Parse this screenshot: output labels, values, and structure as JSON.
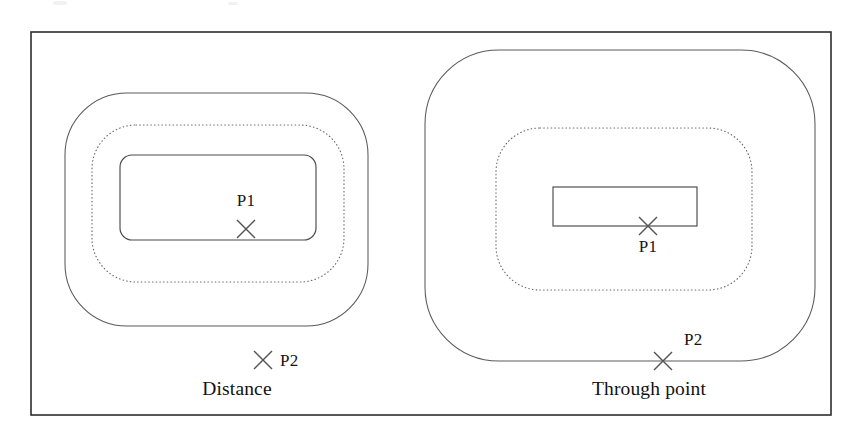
{
  "figure": {
    "kind": "offset-contour-comparison-diagram",
    "frame": {
      "x": 31,
      "y": 32,
      "width": 800,
      "height": 383
    },
    "colors": {
      "background": "#ffffff",
      "frame_stroke": "#2e2e2e",
      "contour_solid": "#5a5a5a",
      "contour_dotted": "#6a6a6a",
      "inner_shape": "#4a4a4a",
      "marker": "#555555",
      "text": "#111111"
    },
    "panels": [
      {
        "id": "distance",
        "caption": "Distance",
        "caption_x": 237,
        "caption_y": 395,
        "inner_shape": {
          "type": "rounded-rect",
          "x": 120,
          "y": 155,
          "width": 196,
          "height": 85,
          "radius": 12
        },
        "contours": [
          {
            "style": "dotted",
            "type": "rounded-rect",
            "x": 92,
            "y": 125,
            "width": 252,
            "height": 157,
            "radius": 44
          },
          {
            "style": "solid",
            "type": "rounded-rect",
            "x": 65,
            "y": 93,
            "width": 303,
            "height": 233,
            "radius": 62
          }
        ],
        "points": [
          {
            "name": "P1",
            "x": 246,
            "y": 229,
            "label_x": 246,
            "label_y": 206,
            "label_anchor": "middle",
            "size": 9,
            "on_contour": false
          },
          {
            "name": "P2",
            "x": 263,
            "y": 360,
            "label_x": 280,
            "label_y": 366,
            "label_anchor": "start",
            "size": 9,
            "on_contour": false
          }
        ]
      },
      {
        "id": "through-point",
        "caption": "Through point",
        "caption_x": 649,
        "caption_y": 395,
        "inner_shape": {
          "type": "rect",
          "x": 553,
          "y": 187,
          "width": 144,
          "height": 39,
          "radius": 0
        },
        "contours": [
          {
            "style": "dotted",
            "type": "rounded-rect",
            "x": 496,
            "y": 128,
            "width": 256,
            "height": 162,
            "radius": 44
          },
          {
            "style": "solid",
            "type": "rounded-rect",
            "x": 425,
            "y": 50,
            "width": 390,
            "height": 311,
            "radius": 74
          }
        ],
        "points": [
          {
            "name": "P1",
            "x": 648,
            "y": 226,
            "label_x": 648,
            "label_y": 252,
            "label_anchor": "middle",
            "size": 9,
            "on_contour": true
          },
          {
            "name": "P2",
            "x": 663,
            "y": 361,
            "label_x": 684,
            "label_y": 345,
            "label_anchor": "start",
            "size": 9,
            "on_contour": true
          }
        ]
      }
    ]
  }
}
